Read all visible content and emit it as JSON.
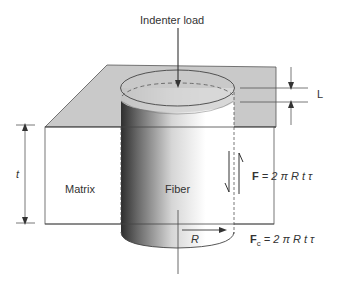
{
  "diagram": {
    "labels": {
      "indenter_load": "Indenter load",
      "length": "L",
      "thickness": "t",
      "matrix": "Matrix",
      "fiber": "Fiber",
      "radius": "R"
    },
    "equations": {
      "friction_force": {
        "symbol": "F",
        "rhs": "= 2 π R t τ"
      },
      "compressive_force": {
        "symbol": "F",
        "subscript": "c",
        "rhs": "= 2 π R t τ"
      }
    },
    "colors": {
      "matrix_top": "#c9c9c9",
      "matrix_front": "#ffffff",
      "outline": "#444444",
      "fiber_dark": "#3a3a3a",
      "fiber_light": "#ffffff"
    }
  }
}
